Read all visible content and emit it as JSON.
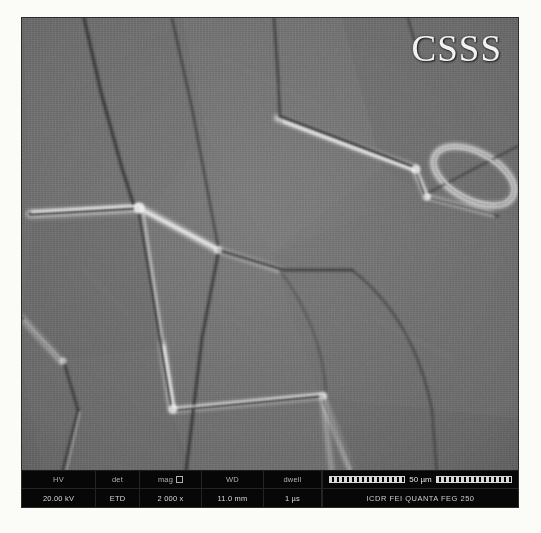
{
  "micrograph": {
    "watermark": "CSSS",
    "description": "SEM secondary-electron micrograph of polycrystalline ceramic showing equiaxed grains with thermally etched grain boundaries"
  },
  "databar": {
    "headers": {
      "hv": "HV",
      "det": "det",
      "mag": "mag",
      "wd": "WD",
      "dwell": "dwell"
    },
    "values": {
      "hv": "20.00 kV",
      "det": "ETD",
      "mag": "2 000 x",
      "wd": "11.0 mm",
      "dwell": "1 µs"
    },
    "scale_bar_label": "50 µm",
    "instrument": "ICDR  FEI QUANTA FEG 250"
  },
  "colors": {
    "grain_interior": "#6a6a6a",
    "boundary_dark": "#2f2f2f",
    "boundary_bright": "#e8e8e8",
    "databar_background": "#070707",
    "page_background": "#fbfbf8"
  }
}
